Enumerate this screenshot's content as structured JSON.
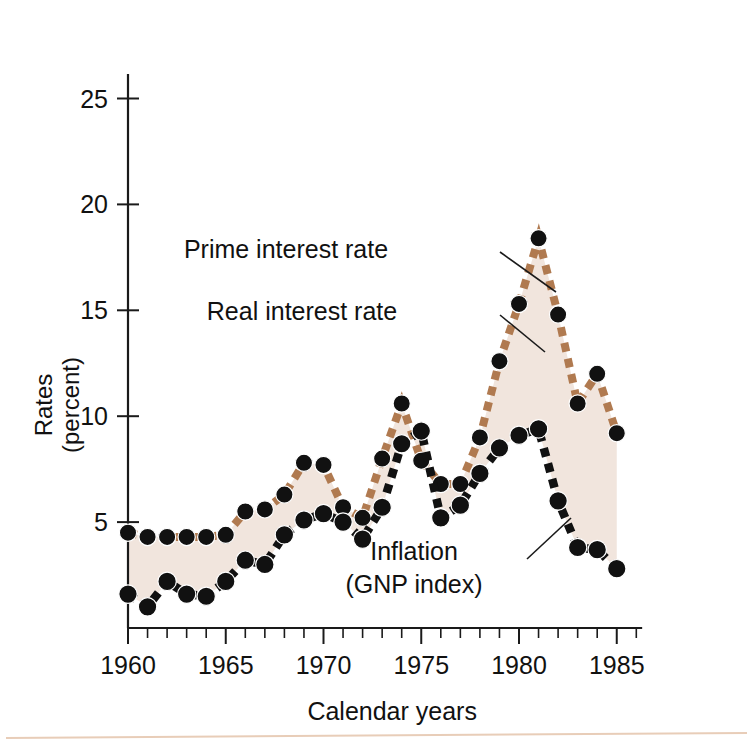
{
  "figure": {
    "name": "interest-rates-and-inflation-chart",
    "background": "#ffffff",
    "band_fill": "#f1e5dd"
  },
  "axes": {
    "x_title": "Calendar years",
    "y_title_line1": "Rates",
    "y_title_line2": "(percent)",
    "x_tick_labels": [
      "1960",
      "1965",
      "1970",
      "1975",
      "1980",
      "1985"
    ],
    "x_tick_values": [
      1960,
      1965,
      1970,
      1975,
      1980,
      1985
    ],
    "y_tick_labels": [
      "5",
      "10",
      "15",
      "20",
      "25"
    ],
    "y_tick_values": [
      5,
      10,
      15,
      20,
      25
    ],
    "x_minor_step": 1,
    "xlim": [
      1959.4,
      1986.2
    ],
    "ylim": [
      0,
      27.5
    ],
    "grid": "off"
  },
  "annotations": [
    {
      "name": "prime-interest-rate-annotation",
      "text": "Prime interest rate",
      "text_x": 286,
      "text_y": 258,
      "leader": [
        [
          500,
          252
        ],
        [
          556,
          292
        ]
      ]
    },
    {
      "name": "real-interest-rate-annotation",
      "text": "Real interest rate",
      "text_x": 302,
      "text_y": 320,
      "leader": [
        [
          500,
          315
        ],
        [
          545,
          352
        ]
      ]
    },
    {
      "name": "inflation-annotation",
      "text_line1": "Inflation",
      "text_line2": "(GNP index)",
      "text_x": 414,
      "text_y": 560,
      "leader": [
        [
          571,
          518
        ],
        [
          527,
          559
        ]
      ]
    }
  ],
  "chart_data": {
    "type": "line",
    "title": "",
    "xlabel": "Calendar years",
    "ylabel": "Rates (percent)",
    "xlim": [
      1959.4,
      1986.2
    ],
    "ylim": [
      0,
      27.5
    ],
    "grid": "off",
    "legend_position": "inline-annotations",
    "shaded_region": {
      "label": "Real interest rate",
      "between": [
        "Prime interest rate",
        "Inflation (GNP index)"
      ],
      "color": "#f1e5dd"
    },
    "x": [
      1960,
      1961,
      1962,
      1963,
      1964,
      1965,
      1966,
      1967,
      1968,
      1969,
      1970,
      1971,
      1972,
      1973,
      1974,
      1975,
      1976,
      1977,
      1978,
      1979,
      1980,
      1981,
      1982,
      1983,
      1984,
      1985
    ],
    "series": [
      {
        "name": "Prime interest rate",
        "color": "#b07a50",
        "marker": "circle",
        "marker_color": "#111111",
        "values": [
          4.5,
          4.3,
          4.3,
          4.3,
          4.3,
          4.4,
          5.5,
          5.6,
          6.3,
          7.8,
          7.7,
          5.7,
          5.2,
          8.0,
          10.6,
          7.9,
          6.8,
          6.8,
          9.0,
          12.6,
          15.3,
          18.4,
          14.8,
          10.6,
          12.0,
          9.2
        ]
      },
      {
        "name": "Inflation (GNP index)",
        "color": "#111111",
        "marker": "circle",
        "marker_color": "#111111",
        "values": [
          1.6,
          1.0,
          2.2,
          1.6,
          1.5,
          2.2,
          3.2,
          3.0,
          4.4,
          5.1,
          5.4,
          5.0,
          4.2,
          5.7,
          8.7,
          9.3,
          5.2,
          5.8,
          7.3,
          8.5,
          9.1,
          9.4,
          6.0,
          3.8,
          3.7,
          2.8
        ]
      }
    ]
  }
}
